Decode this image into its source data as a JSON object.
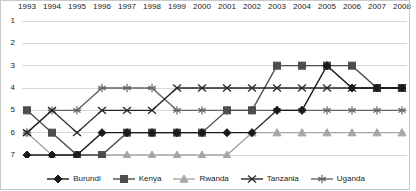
{
  "chart_data": {
    "type": "line",
    "title": "",
    "subtitle": "",
    "xlabel": "",
    "ylabel": "",
    "x": [
      1993,
      1994,
      1995,
      1996,
      1997,
      1998,
      1999,
      2000,
      2001,
      2002,
      2003,
      2004,
      2005,
      2006,
      2007,
      2008
    ],
    "categories": [
      "1993",
      "1994",
      "1995",
      "1996",
      "1997",
      "1998",
      "1999",
      "2000",
      "2001",
      "2002",
      "2003",
      "2004",
      "2005",
      "2006",
      "2007",
      "2008"
    ],
    "xlim": [
      1993,
      2008
    ],
    "ylim": [
      1,
      7
    ],
    "y_inverted": true,
    "yticks": [
      1,
      2,
      3,
      4,
      5,
      6,
      7
    ],
    "ytick_labels": [
      "1",
      "2",
      "3",
      "4",
      "5",
      "6",
      "7"
    ],
    "grid": "horizontal",
    "legend_position": "bottom",
    "series": [
      {
        "name": "Burundi",
        "marker": "diamond",
        "color": "#1a1a1a",
        "values": [
          7,
          7,
          7,
          6,
          6,
          6,
          6,
          6,
          6,
          6,
          5,
          5,
          3,
          4,
          4,
          4
        ]
      },
      {
        "name": "Kenya",
        "marker": "square",
        "color": "#4d4d4d",
        "values": [
          5,
          6,
          7,
          7,
          6,
          6,
          6,
          6,
          5,
          5,
          3,
          3,
          3,
          3,
          4,
          4
        ]
      },
      {
        "name": "Rwanda",
        "marker": "triangle",
        "color": "#a6a6a6",
        "values": [
          6,
          7,
          7,
          7,
          7,
          7,
          7,
          7,
          7,
          6,
          6,
          6,
          6,
          6,
          6,
          6
        ]
      },
      {
        "name": "Tanzania",
        "marker": "cross",
        "color": "#262626",
        "values": [
          6,
          5,
          6,
          5,
          5,
          5,
          4,
          4,
          4,
          4,
          4,
          4,
          4,
          4,
          4,
          4
        ]
      },
      {
        "name": "Uganda",
        "marker": "asterisk",
        "color": "#666666",
        "values": [
          6,
          5,
          5,
          4,
          4,
          4,
          5,
          5,
          5,
          5,
          5,
          5,
          5,
          5,
          5,
          5
        ]
      }
    ]
  },
  "axes": {
    "x_tick_labels": [
      "1993",
      "1994",
      "1995",
      "1996",
      "1997",
      "1998",
      "1999",
      "2000",
      "2001",
      "2002",
      "2003",
      "2004",
      "2005",
      "2006",
      "2007",
      "2008"
    ],
    "y_tick_labels": [
      "1",
      "2",
      "3",
      "4",
      "5",
      "6",
      "7"
    ]
  },
  "legend": {
    "items": [
      {
        "label": "Burundi",
        "marker": "diamond-marker",
        "color": "#1a1a1a"
      },
      {
        "label": "Kenya",
        "marker": "square-marker",
        "color": "#4d4d4d"
      },
      {
        "label": "Rwanda",
        "marker": "triangle-marker",
        "color": "#a6a6a6"
      },
      {
        "label": "Tanzania",
        "marker": "cross-marker",
        "color": "#262626"
      },
      {
        "label": "Uganda",
        "marker": "asterisk-marker",
        "color": "#666666"
      }
    ]
  },
  "style": {
    "grid_color": "#d9d9d9",
    "text_color": "#222222",
    "background": "#ffffff",
    "border_color": "#c9c9c9"
  }
}
